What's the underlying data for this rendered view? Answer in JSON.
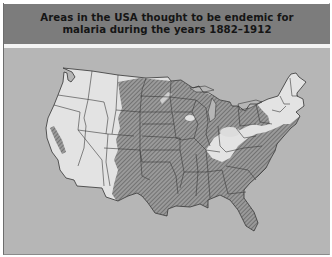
{
  "figure": {
    "title_lines": [
      "Areas in the USA thought to be endemic for",
      "malaria during the years 1882–1912"
    ]
  },
  "map": {
    "region": "Contiguous United States",
    "legend_meaning": "Hatched areas = endemic for malaria",
    "colors": {
      "title_bar": "#7c7c7c",
      "background": "#b6b6b6",
      "land_non_endemic": "#e3e3e3",
      "endemic_hatch_fill": "#8e8e8e",
      "borders": "#3a3a3a"
    }
  }
}
